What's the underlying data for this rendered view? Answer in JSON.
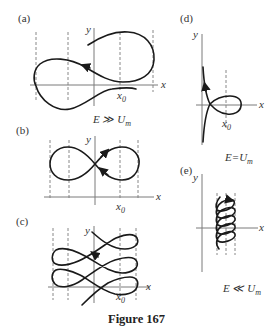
{
  "figure": {
    "caption": "Figure 167",
    "panels": [
      {
        "id": "a",
        "label": "(a)",
        "x_label": "x",
        "y_label": "y",
        "x0_label": "x",
        "x0_sub": "0",
        "condition": "E ≫ U",
        "condition_sub": "m",
        "shape": "two unequal loops crossing, open ends"
      },
      {
        "id": "b",
        "label": "(b)",
        "x_label": "x",
        "y_label": "y",
        "x0_label": "x",
        "x0_sub": "0",
        "shape": "figure-eight (lemniscate)"
      },
      {
        "id": "c",
        "label": "(c)",
        "x_label": "x",
        "y_label": "y",
        "x0_label": "x",
        "x0_sub": "0",
        "shape": "stacked figure-eight loops"
      },
      {
        "id": "d",
        "label": "(d)",
        "x_label": "x",
        "y_label": "y",
        "x0_label": "x",
        "x0_sub": "0",
        "condition": "E=U",
        "condition_sub": "m",
        "shape": "single loop with asymptotic tails"
      },
      {
        "id": "e",
        "label": "(e)",
        "x_label": "x",
        "y_label": "y",
        "condition": "E ≪ U",
        "condition_sub": "m",
        "shape": "tight helical coil drifting along y"
      }
    ],
    "colors": {
      "curve": "#1a1a1a",
      "axis": "#7a7a7a",
      "dashed": "#6a6a6a",
      "background": "#ffffff"
    }
  }
}
